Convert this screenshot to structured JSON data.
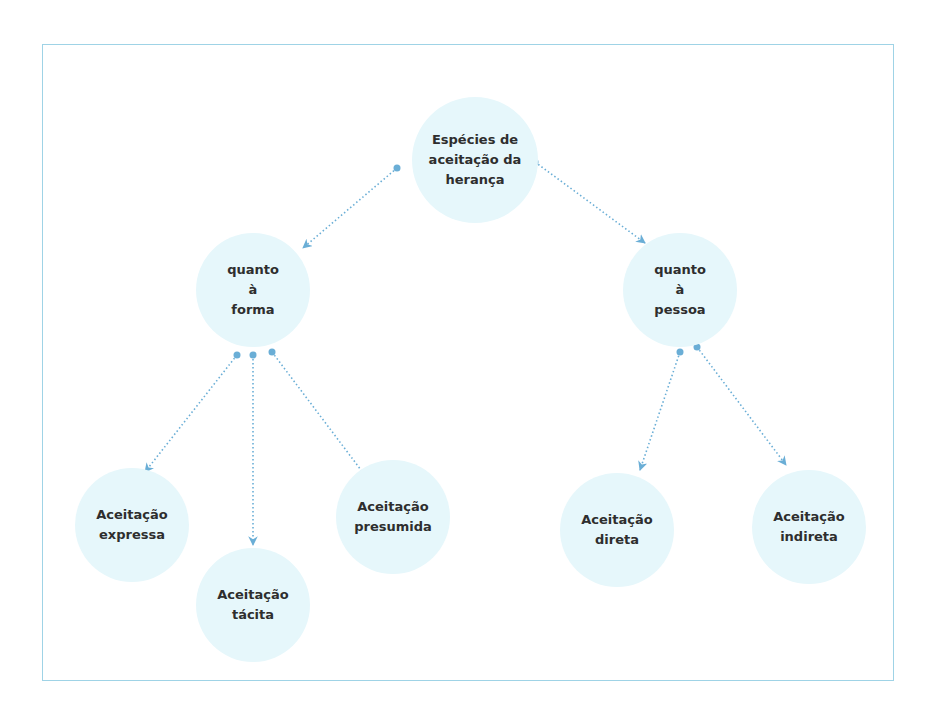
{
  "diagram": {
    "title": "Espécies de aceitação da herança",
    "colors": {
      "node_fill": "#e6f7fb",
      "frame_border": "#9fd3e6",
      "connector": "#6aaed6",
      "text": "#2e2e2e"
    },
    "nodes": [
      {
        "id": "root",
        "label": "Espécies de\naceitação da\nherança",
        "cx": 475,
        "cy": 160,
        "r": 63
      },
      {
        "id": "forma",
        "label": "quanto\nà\nforma",
        "cx": 253,
        "cy": 290,
        "r": 57
      },
      {
        "id": "pessoa",
        "label": "quanto\nà\npessoa",
        "cx": 680,
        "cy": 290,
        "r": 57
      },
      {
        "id": "expressa",
        "label": "Aceitação\nexpressa",
        "cx": 132,
        "cy": 525,
        "r": 57
      },
      {
        "id": "tacita",
        "label": "Aceitação\ntácita",
        "cx": 253,
        "cy": 605,
        "r": 57
      },
      {
        "id": "presumida",
        "label": "Aceitação\npresumida",
        "cx": 393,
        "cy": 517,
        "r": 57
      },
      {
        "id": "direta",
        "label": "Aceitação\ndireta",
        "cx": 617,
        "cy": 530,
        "r": 57
      },
      {
        "id": "indireta",
        "label": "Aceitação\nindireta",
        "cx": 809,
        "cy": 527,
        "r": 57
      }
    ],
    "edges": [
      {
        "from": "root",
        "to": "forma",
        "x1": 397,
        "y1": 168,
        "x2": 303,
        "y2": 248
      },
      {
        "from": "root",
        "to": "pessoa",
        "x1": 535,
        "y1": 162,
        "x2": 645,
        "y2": 243
      },
      {
        "from": "forma",
        "to": "expressa",
        "x1": 237,
        "y1": 355,
        "x2": 145,
        "y2": 472
      },
      {
        "from": "forma",
        "to": "tacita",
        "x1": 253,
        "y1": 355,
        "x2": 253,
        "y2": 545
      },
      {
        "from": "forma",
        "to": "presumida",
        "x1": 272,
        "y1": 352,
        "x2": 367,
        "y2": 478
      },
      {
        "from": "pessoa",
        "to": "direta",
        "x1": 680,
        "y1": 352,
        "x2": 640,
        "y2": 470
      },
      {
        "from": "pessoa",
        "to": "indireta",
        "x1": 697,
        "y1": 347,
        "x2": 786,
        "y2": 465
      }
    ]
  }
}
